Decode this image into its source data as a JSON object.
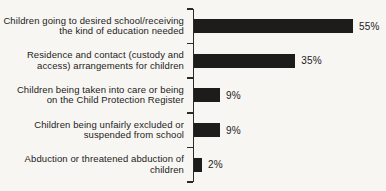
{
  "chart_data": {
    "type": "bar",
    "orientation": "horizontal",
    "title": "",
    "xlabel": "",
    "ylabel": "",
    "xlim": [
      0,
      60
    ],
    "grid": false,
    "legend": false,
    "bar_color": "#1e1c1b",
    "axis_color": "#2b2a28",
    "categories": [
      "Children going to desired school/receiving the kind of education needed",
      "Residence and contact (custody and access) arrangements for children",
      "Children being taken into care or being on the Child Protection Register",
      "Children being unfairly excluded or suspended from school",
      "Abduction or threatened abduction of children"
    ],
    "category_lines": [
      [
        "Children going to desired school/receiving",
        "the kind of education needed"
      ],
      [
        "Residence and contact (custody and",
        "access) arrangements for children"
      ],
      [
        "Children being taken into care or being",
        "on the Child Protection Register"
      ],
      [
        "Children being unfairly excluded or",
        "suspended from school"
      ],
      [
        "Abduction or threatened abduction of",
        "children"
      ]
    ],
    "values": [
      55,
      35,
      9,
      9,
      2
    ],
    "value_labels": [
      "55%",
      "35%",
      "9%",
      "9%",
      "2%"
    ]
  }
}
